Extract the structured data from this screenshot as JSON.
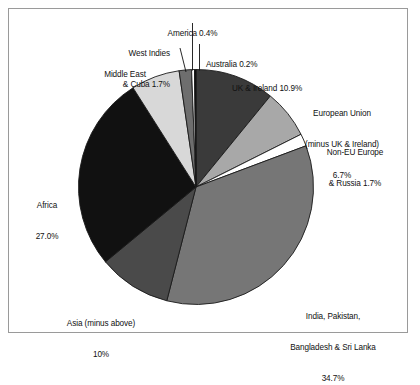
{
  "figure": {
    "background_color": "#ffffff",
    "frame_color": "#9a9a9a"
  },
  "chart_data": {
    "type": "pie",
    "title": "",
    "subtitle": "",
    "xlabel": "",
    "ylabel": "",
    "legend_position": "none",
    "grid": false,
    "labels_outside": true,
    "start_angle_deg": -90,
    "direction": "clockwise",
    "categories": [
      "UK & Ireland",
      "European Union (minus UK & Ireland)",
      "Non-EU Europe & Russia",
      "India, Pakistan, Bangladesh & Sri Lanka",
      "Asia (minus above)",
      "Africa",
      "Middle East",
      "West Indies & Cuba",
      "America",
      "Australia"
    ],
    "values": [
      10.9,
      6.7,
      1.7,
      34.7,
      10.0,
      27.0,
      6.7,
      1.7,
      0.4,
      0.2
    ],
    "value_labels": [
      "10.9%",
      "6.7%",
      "1.7%",
      "34.7%",
      "10%",
      "27.0%",
      "6.7%",
      "1.7%",
      "0.4%",
      "0.2%"
    ],
    "colors": [
      "#3a3a3a",
      "#a8a8a8",
      "#ffffff",
      "#767676",
      "#4a4a4a",
      "#111111",
      "#d8d8d8",
      "#6e6e6e",
      "#ffffff",
      "#0a0a0a"
    ],
    "slice_edge_color": "#1a1a1a",
    "total": 100.0
  },
  "labels": {
    "america": {
      "lines": [
        "America 0.4%"
      ]
    },
    "west_indies": {
      "lines": [
        "West Indies",
        "& Cuba 1.7%"
      ]
    },
    "australia": {
      "lines": [
        "Australia 0.2%"
      ]
    },
    "middle_east": {
      "lines": [
        "Middle East",
        "6.7%"
      ]
    },
    "uk_ireland": {
      "lines": [
        "UK & Ireland 10.9%"
      ]
    },
    "european_union": {
      "lines": [
        "European Union",
        "(minus UK & Ireland)",
        "6.7%"
      ]
    },
    "non_eu_europe": {
      "lines": [
        "Non-EU Europe",
        "& Russia 1.7%"
      ]
    },
    "india_etc": {
      "lines": [
        "India, Pakistan,",
        "Bangladesh & Sri Lanka",
        "34.7%"
      ]
    },
    "asia": {
      "lines": [
        "Asia (minus above)",
        "10%"
      ]
    },
    "africa": {
      "lines": [
        "Africa",
        "27.0%"
      ]
    }
  }
}
